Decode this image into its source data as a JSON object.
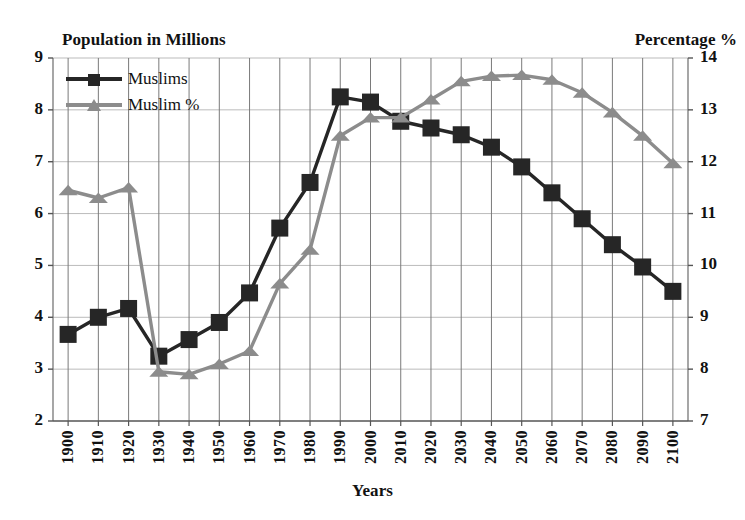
{
  "chart_data": {
    "type": "line",
    "title": "",
    "xlabel": "Years",
    "ylabel": "Population in Millions",
    "y2label": "Percentage %",
    "grid": true,
    "legend_position": "top-left",
    "categories": [
      "1900",
      "1910",
      "1920",
      "1930",
      "1940",
      "1950",
      "1960",
      "1970",
      "1980",
      "1990",
      "2000",
      "2010",
      "2020",
      "2030",
      "2040",
      "2050",
      "2060",
      "2070",
      "2080",
      "2090",
      "2100"
    ],
    "ylim": [
      2,
      9
    ],
    "yticks": [
      "9",
      "8",
      "7",
      "6",
      "5",
      "4",
      "3",
      "2"
    ],
    "y2lim": [
      7,
      14
    ],
    "y2ticks": [
      "14",
      "13",
      "12",
      "11",
      "10",
      "9",
      "8",
      "7"
    ],
    "series": [
      {
        "name": "Muslims",
        "axis": "left",
        "color": "#262626",
        "marker": "square",
        "values": [
          3.67,
          4.0,
          4.17,
          3.25,
          3.57,
          3.9,
          4.47,
          5.72,
          6.6,
          8.25,
          8.15,
          7.78,
          7.65,
          7.52,
          7.28,
          6.9,
          6.4,
          5.9,
          5.4,
          4.97,
          4.5
        ]
      },
      {
        "name": "Muslim %",
        "axis": "right",
        "color": "#8c8c8c",
        "marker": "triangle",
        "values": [
          11.45,
          11.3,
          11.5,
          7.95,
          7.9,
          8.1,
          8.35,
          9.65,
          10.3,
          12.5,
          12.85,
          12.85,
          13.2,
          13.55,
          13.65,
          13.67,
          13.58,
          13.33,
          12.95,
          12.5,
          11.97
        ]
      }
    ]
  },
  "legend": {
    "items": [
      {
        "label": "Muslims"
      },
      {
        "label": "Muslim %"
      }
    ]
  }
}
